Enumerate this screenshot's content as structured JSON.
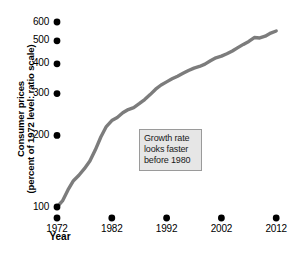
{
  "chart_data": {
    "type": "line",
    "title": "",
    "xlabel": "Year",
    "ylabel_line1": "Consumer prices",
    "ylabel_line2": "(percent of 1972 level: ratio scale)",
    "yscale": "log",
    "ylim": [
      85,
      650
    ],
    "xlim": [
      1972,
      2013
    ],
    "grid": false,
    "legend": "none",
    "line_color": "#7c7c7c",
    "tick_color": "#000000",
    "y_ticks": [
      100,
      200,
      300,
      400,
      500,
      600
    ],
    "y_tick_labels": [
      "100",
      "200",
      "300",
      "400",
      "500",
      "600"
    ],
    "x_ticks": [
      1972,
      1982,
      1992,
      2002,
      2012
    ],
    "x_tick_labels": [
      "1972",
      "1982",
      "1992",
      "2002",
      "2012"
    ],
    "series": [
      {
        "name": "Consumer prices (1972 = 100)",
        "x": [
          1972,
          1973,
          1974,
          1975,
          1976,
          1977,
          1978,
          1979,
          1980,
          1981,
          1982,
          1983,
          1984,
          1985,
          1986,
          1987,
          1988,
          1989,
          1990,
          1991,
          1992,
          1993,
          1994,
          1995,
          1996,
          1997,
          1998,
          1999,
          2000,
          2001,
          2002,
          2003,
          2004,
          2005,
          2006,
          2007,
          2008,
          2009,
          2010,
          2011,
          2012
        ],
        "values": [
          100,
          106,
          118,
          129,
          136,
          145,
          156,
          174,
          197,
          218,
          231,
          238,
          249,
          257,
          262,
          272,
          283,
          297,
          313,
          326,
          336,
          346,
          355,
          365,
          375,
          384,
          390,
          399,
          412,
          424,
          431,
          441,
          453,
          468,
          483,
          497,
          516,
          514,
          523,
          539,
          550
        ]
      }
    ],
    "annotation": {
      "lines": [
        "Growth rate",
        "looks faster",
        "before 1980"
      ],
      "box_fill": "#e6e6e6",
      "box_border": "#9a9a9a"
    }
  },
  "figure": {
    "caption_partial": ""
  }
}
